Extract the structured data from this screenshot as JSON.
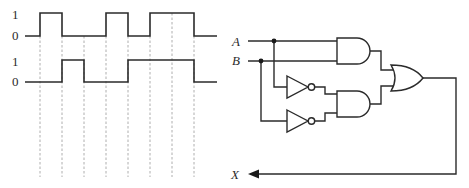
{
  "timing_diagram": {
    "waveforms": [
      {
        "name": "waveform-1",
        "high_label": "1",
        "low_label": "0",
        "levels": [
          0,
          1,
          0,
          0,
          1,
          0,
          1,
          1,
          0
        ]
      },
      {
        "name": "waveform-2",
        "high_label": "1",
        "low_label": "0",
        "levels": [
          0,
          0,
          1,
          0,
          0,
          1,
          1,
          1,
          0
        ]
      }
    ],
    "time_divisions": 8
  },
  "circuit": {
    "inputs": {
      "a": "A",
      "b": "B"
    },
    "output": "X",
    "gates": [
      {
        "id": "and1",
        "type": "AND",
        "inputs": [
          "A",
          "B"
        ]
      },
      {
        "id": "not1",
        "type": "NOT",
        "inputs": [
          "A"
        ]
      },
      {
        "id": "not2",
        "type": "NOT",
        "inputs": [
          "B"
        ]
      },
      {
        "id": "and2",
        "type": "AND",
        "inputs": [
          "NOT A",
          "NOT B"
        ]
      },
      {
        "id": "or1",
        "type": "OR",
        "inputs": [
          "and1",
          "and2"
        ]
      }
    ]
  }
}
